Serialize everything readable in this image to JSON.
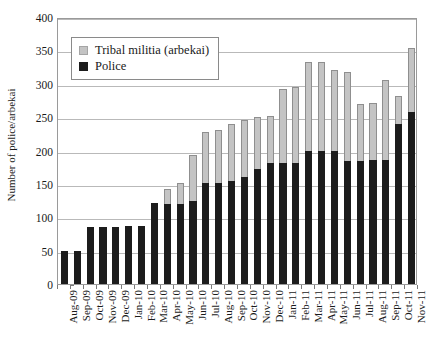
{
  "chart_data": {
    "type": "bar",
    "stacked": true,
    "title": "",
    "xlabel": "",
    "ylabel": "Number of police/arbekai",
    "ylim": [
      0,
      400
    ],
    "ytick_step": 50,
    "yticks": [
      0,
      50,
      100,
      150,
      200,
      250,
      300,
      350,
      400
    ],
    "grid": true,
    "legend_position": "upper-left-inside",
    "categories": [
      "Aug-09",
      "Sep-09",
      "Oct-09",
      "Nov-09",
      "Dec-09",
      "Jan-10",
      "Feb-10",
      "Mar-10",
      "Apr-10",
      "May-10",
      "Jun-10",
      "Jul-10",
      "Aug-10",
      "Sep-10",
      "Oct-10",
      "Nov-10",
      "Dec-10",
      "Jan-11",
      "Feb-11",
      "Mar-11",
      "Apr-11",
      "May-11",
      "Jun-11",
      "Jul-11",
      "Aug-11",
      "Sep-11",
      "Oct-11",
      "Nov-11"
    ],
    "series": [
      {
        "name": "Police",
        "color": "#1c1c1c",
        "values": [
          50,
          50,
          85,
          85,
          85,
          87,
          87,
          122,
          120,
          120,
          125,
          152,
          152,
          155,
          160,
          172,
          182,
          182,
          182,
          200,
          200,
          200,
          185,
          185,
          186,
          186,
          240,
          258
        ]
      },
      {
        "name": "Tribal militia (arbekai)",
        "color": "#c4c4c4",
        "values": [
          0,
          0,
          0,
          0,
          0,
          0,
          0,
          0,
          22,
          32,
          68,
          76,
          78,
          85,
          85,
          78,
          70,
          110,
          113,
          133,
          133,
          120,
          132,
          85,
          85,
          119,
          42,
          95
        ]
      }
    ],
    "totals": [
      50,
      50,
      85,
      85,
      85,
      87,
      87,
      122,
      142,
      152,
      193,
      228,
      230,
      240,
      245,
      250,
      252,
      292,
      295,
      333,
      333,
      320,
      317,
      270,
      271,
      305,
      282,
      353
    ],
    "annotations": []
  },
  "legend": {
    "entries": [
      {
        "label": "Tribal militia (arbekai)",
        "swatch": "militia"
      },
      {
        "label": "Police",
        "swatch": "police"
      }
    ]
  },
  "axes": {
    "y_title": "Number of police/arbekai",
    "y_tick_labels": [
      "400",
      "350",
      "300",
      "250",
      "200",
      "150",
      "100",
      "50",
      "0"
    ]
  }
}
